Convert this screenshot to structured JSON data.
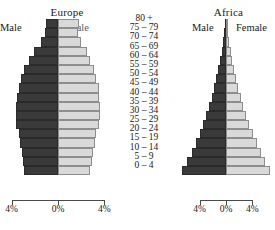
{
  "chart_data": {
    "type": "bar",
    "chart_kind": "population-pyramid",
    "title": "",
    "xlabel": "",
    "ylabel": "",
    "categories": [
      "80 +",
      "75 – 79",
      "70 – 74",
      "65 – 69",
      "60 – 64",
      "55 – 59",
      "50 – 54",
      "45 – 49",
      "40 – 44",
      "35 – 39",
      "30 – 34",
      "25 – 29",
      "20 – 24",
      "15 – 19",
      "10 – 14",
      "5 – 9",
      "0 – 4"
    ],
    "xlim": [
      -4,
      4
    ],
    "xunit": "%",
    "grid": false,
    "legend_position": "above-panels",
    "panels": [
      {
        "name": "Europe",
        "male_label": "Male",
        "female_label": "Female",
        "series": [
          {
            "name": "Male",
            "values": [
              1.0,
              1.1,
              1.5,
              2.1,
              2.5,
              2.9,
              3.2,
              3.4,
              3.5,
              3.6,
              3.6,
              3.6,
              3.4,
              3.3,
              3.1,
              3.0,
              2.9
            ]
          },
          {
            "name": "Female",
            "values": [
              1.8,
              1.7,
              2.0,
              2.5,
              2.8,
              3.1,
              3.3,
              3.5,
              3.5,
              3.6,
              3.6,
              3.5,
              3.3,
              3.2,
              3.0,
              2.9,
              2.8
            ]
          }
        ]
      },
      {
        "name": "Africa",
        "male_label": "Male",
        "female_label": "Female",
        "series": [
          {
            "name": "Male",
            "values": [
              0.2,
              0.3,
              0.45,
              0.65,
              0.9,
              1.15,
              1.45,
              1.8,
              2.15,
              2.55,
              3.0,
              3.5,
              4.0,
              4.6,
              5.2,
              5.9,
              6.6
            ]
          },
          {
            "name": "Female",
            "values": [
              0.25,
              0.35,
              0.5,
              0.7,
              0.95,
              1.2,
              1.5,
              1.85,
              2.2,
              2.6,
              3.05,
              3.55,
              4.05,
              4.65,
              5.25,
              5.95,
              6.6
            ]
          }
        ]
      }
    ],
    "axis_ticks": [
      {
        "label": "4%",
        "value": -4
      },
      {
        "label": "0%",
        "value": 0
      },
      {
        "label": "4%",
        "value": 4
      }
    ],
    "colors": {
      "male": "#3a3a3a",
      "female": "#d9d9d9",
      "bar_outline": "#6a6a6a",
      "axis": "#4a4a4a",
      "text": "#1a1a1a",
      "background": "#ffffff"
    }
  }
}
